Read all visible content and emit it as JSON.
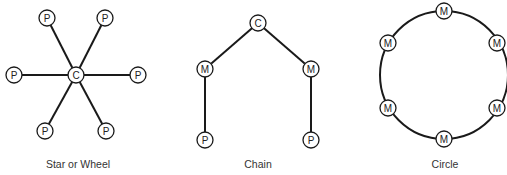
{
  "diagrams": [
    {
      "id": "star",
      "caption": "Star or Wheel",
      "nodes": [
        {
          "label": "C",
          "x": 76,
          "y": 75
        },
        {
          "label": "P",
          "x": 47,
          "y": 18
        },
        {
          "label": "P",
          "x": 105,
          "y": 18
        },
        {
          "label": "P",
          "x": 14,
          "y": 75
        },
        {
          "label": "P",
          "x": 138,
          "y": 75
        },
        {
          "label": "P",
          "x": 45,
          "y": 131
        },
        {
          "label": "P",
          "x": 106,
          "y": 131
        }
      ],
      "edges": [
        [
          0,
          1
        ],
        [
          0,
          2
        ],
        [
          0,
          3
        ],
        [
          0,
          4
        ],
        [
          0,
          5
        ],
        [
          0,
          6
        ]
      ]
    },
    {
      "id": "chain",
      "caption": "Chain",
      "nodes": [
        {
          "label": "C",
          "x": 258,
          "y": 23
        },
        {
          "label": "M",
          "x": 205,
          "y": 69
        },
        {
          "label": "M",
          "x": 311,
          "y": 69
        },
        {
          "label": "P",
          "x": 205,
          "y": 140
        },
        {
          "label": "P",
          "x": 311,
          "y": 140
        }
      ],
      "edges": [
        [
          0,
          1
        ],
        [
          0,
          2
        ],
        [
          1,
          3
        ],
        [
          2,
          4
        ]
      ]
    },
    {
      "id": "circle",
      "caption": "Circle",
      "ring": {
        "cx": 444,
        "cy": 75,
        "r": 64
      },
      "nodes": [
        {
          "label": "M",
          "x": 444,
          "y": 11
        },
        {
          "label": "M",
          "x": 497,
          "y": 43
        },
        {
          "label": "M",
          "x": 497,
          "y": 108
        },
        {
          "label": "M",
          "x": 444,
          "y": 139
        },
        {
          "label": "M",
          "x": 388,
          "y": 108
        },
        {
          "label": "M",
          "x": 388,
          "y": 43
        }
      ],
      "edges": []
    }
  ],
  "captions": {
    "star": "Star or Wheel",
    "chain": "Chain",
    "circle": "Circle"
  }
}
